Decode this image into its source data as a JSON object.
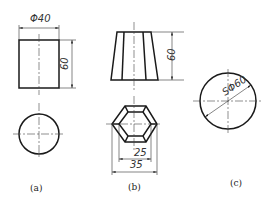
{
  "figure": {
    "panels": [
      {
        "id": "a",
        "caption": "(a)",
        "shape": "cylinder",
        "views": [
          "front-rectangle",
          "top-circle"
        ],
        "dimensions": {
          "diameter": "Φ40",
          "height": "60"
        }
      },
      {
        "id": "b",
        "caption": "(b)",
        "shape": "hexagonal frustum",
        "views": [
          "front-trapezoid",
          "top-nested-hexagons"
        ],
        "dimensions": {
          "height": "60",
          "inner_width": "25",
          "outer_width": "35"
        }
      },
      {
        "id": "c",
        "caption": "(c)",
        "shape": "sphere",
        "views": [
          "single-circle"
        ],
        "dimensions": {
          "diameter": "SΦ60"
        }
      }
    ]
  }
}
